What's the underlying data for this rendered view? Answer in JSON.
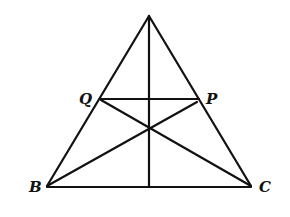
{
  "diagram": {
    "type": "triangle-cevians",
    "points": {
      "A": {
        "x": 149,
        "y": 16,
        "label": ""
      },
      "B": {
        "x": 47,
        "y": 186,
        "label": "B"
      },
      "C": {
        "x": 251,
        "y": 186,
        "label": "C"
      },
      "Q": {
        "x": 101,
        "y": 99,
        "label": "Q"
      },
      "P": {
        "x": 199,
        "y": 99,
        "label": "P"
      },
      "O": {
        "x": 149,
        "y": 128,
        "label": ""
      },
      "D": {
        "x": 149,
        "y": 186,
        "label": ""
      }
    },
    "segments": [
      [
        "A",
        "B"
      ],
      [
        "A",
        "C"
      ],
      [
        "B",
        "C"
      ],
      [
        "A",
        "D"
      ],
      [
        "Q",
        "P"
      ],
      [
        "B",
        "P"
      ],
      [
        "C",
        "Q"
      ]
    ],
    "labels": {
      "B": "B",
      "C": "C",
      "Q": "Q",
      "P": "P"
    },
    "colors": {
      "line": "#111111",
      "background": "#ffffff"
    }
  }
}
